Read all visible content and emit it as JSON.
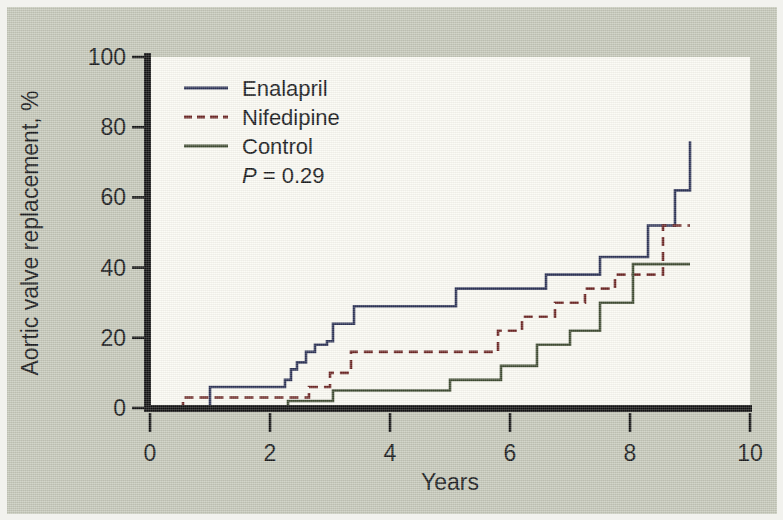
{
  "figure": {
    "background_color": "#c5c8b9",
    "panel_color": "#fbfaf3",
    "axis_color": "#111111"
  },
  "chart_data": {
    "type": "line",
    "title": "",
    "subtitle": "",
    "xlabel": "Years",
    "ylabel": "Aortic valve replacement, %",
    "xlim": [
      0,
      10
    ],
    "ylim": [
      0,
      100
    ],
    "xticks": [
      0,
      2,
      4,
      6,
      8,
      10
    ],
    "xticklabels": [
      "0",
      "2",
      "4",
      "6",
      "8",
      "10"
    ],
    "yticks": [
      0,
      20,
      40,
      60,
      80,
      100
    ],
    "yticklabels": [
      "0",
      "20",
      "40",
      "60",
      "80",
      "100"
    ],
    "grid": false,
    "legend_position": "top-left",
    "annotations": [
      {
        "name": "p-value",
        "text_italic": "P",
        "text": " = 0.29"
      }
    ],
    "step_style": "post",
    "series": [
      {
        "name": "Enalapril",
        "color": "#2b3155",
        "linestyle": "solid",
        "linewidth": 2.6,
        "x": [
          0.55,
          0.95,
          1.0,
          2.2,
          2.25,
          2.35,
          2.45,
          2.6,
          2.75,
          2.95,
          3.05,
          3.3,
          3.4,
          4.95,
          5.1,
          6.45,
          6.6,
          7.35,
          7.5,
          8.15,
          8.3,
          8.6,
          8.75,
          9.0
        ],
        "y": [
          0,
          0,
          6,
          6,
          8,
          11,
          13,
          16,
          18,
          19,
          24,
          24,
          29,
          29,
          34,
          34,
          38,
          38,
          43,
          43,
          52,
          52,
          62,
          76
        ]
      },
      {
        "name": "Nifedipine",
        "color": "#6b2422",
        "linestyle": "dashed",
        "linewidth": 2.6,
        "x": [
          0.5,
          0.55,
          2.55,
          2.65,
          2.85,
          3.0,
          3.15,
          3.35,
          5.15,
          5.3,
          5.65,
          5.8,
          6.05,
          6.2,
          6.55,
          6.75,
          7.05,
          7.25,
          7.55,
          7.75,
          8.35,
          8.55,
          9.0
        ],
        "y": [
          0,
          3,
          3,
          6,
          6,
          10,
          10,
          16,
          16,
          16,
          16,
          22,
          22,
          26,
          26,
          30,
          30,
          34,
          34,
          38,
          38,
          52,
          52
        ]
      },
      {
        "name": "Control",
        "color": "#3e4a30",
        "linestyle": "solid",
        "linewidth": 2.6,
        "x": [
          2.25,
          2.3,
          2.95,
          3.05,
          3.8,
          3.9,
          4.85,
          5.0,
          5.7,
          5.85,
          6.3,
          6.45,
          6.85,
          7.0,
          7.35,
          7.5,
          7.9,
          8.05,
          9.0
        ],
        "y": [
          0,
          2,
          2,
          5,
          5,
          5,
          5,
          8,
          8,
          12,
          12,
          18,
          18,
          22,
          22,
          30,
          30,
          41,
          41
        ]
      }
    ]
  },
  "legend": {
    "items": [
      {
        "label": "Enalapril",
        "color": "#2b3155",
        "style": "solid"
      },
      {
        "label": "Nifedipine",
        "color": "#6b2422",
        "style": "dashed"
      },
      {
        "label": "Control",
        "color": "#3e4a30",
        "style": "solid"
      }
    ],
    "pvalue_italic": "P",
    "pvalue_rest": " = 0.29"
  }
}
